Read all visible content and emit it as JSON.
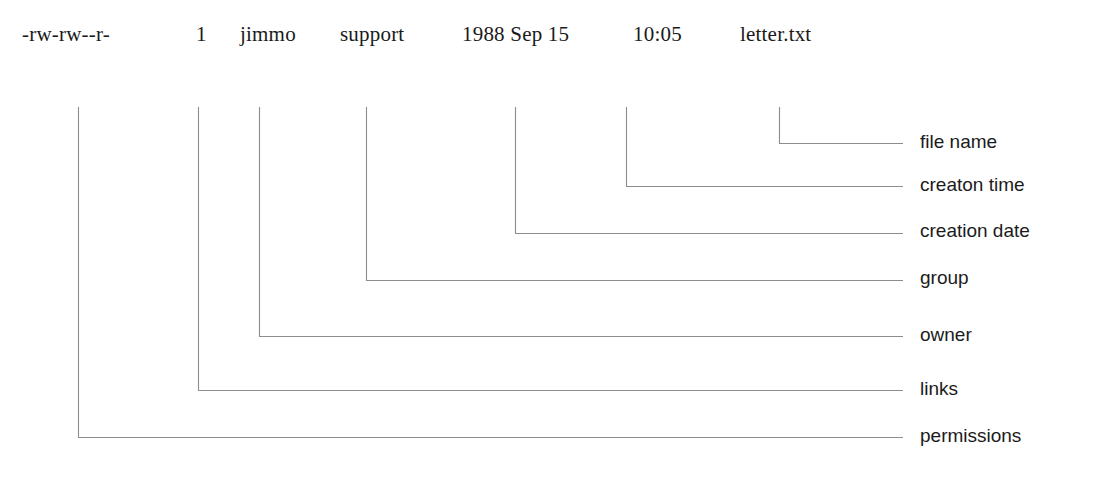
{
  "figure": {
    "kind": "annotated-diagram"
  },
  "listing": {
    "permissions": "-rw-rw--r-",
    "links": "1",
    "owner": "jimmo",
    "group": "support",
    "date": "1988 Sep 15",
    "time": "10:05",
    "filename": "letter.txt"
  },
  "captions": {
    "filename": "file name",
    "creation_time": "creaton time",
    "creation_date": "creation date",
    "group": "group",
    "owner": "owner",
    "links": "links",
    "permissions": "permissions"
  },
  "colors": {
    "background": "#ffffff",
    "text": "#1a1a1a",
    "leader_line": "#8d8d8d"
  }
}
